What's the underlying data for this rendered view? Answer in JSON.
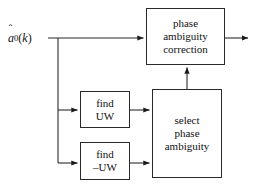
{
  "figure": {
    "type": "block-diagram",
    "title": "",
    "background_color": "#ffffff",
    "line_color": "#2a2a2a",
    "text_color": "#111111"
  },
  "input": {
    "name": "input-signal",
    "label_plain": "â0(k)",
    "base_symbol": "a",
    "hat": "ˆ",
    "subscript": "0",
    "argument": "(k)"
  },
  "blocks": [
    {
      "id": "phase-ambiguity-correction",
      "lines": [
        "phase",
        "ambiguity",
        "correction"
      ]
    },
    {
      "id": "find-uw",
      "lines": [
        "find",
        "UW"
      ]
    },
    {
      "id": "find-minus-uw",
      "lines": [
        "find",
        "–UW"
      ]
    },
    {
      "id": "select-phase-ambiguity",
      "lines": [
        "select",
        "phase",
        "ambiguity"
      ]
    }
  ],
  "connections": [
    {
      "id": "input-to-correction",
      "from": "input-signal",
      "to": "phase-ambiguity-correction",
      "arrow": true
    },
    {
      "id": "input-branch-to-find-uw",
      "from": "input-signal",
      "to": "find-uw",
      "arrow": true
    },
    {
      "id": "input-branch-to-find-minus-uw",
      "from": "input-signal",
      "to": "find-minus-uw",
      "arrow": true
    },
    {
      "id": "find-uw-to-select",
      "from": "find-uw",
      "to": "select-phase-ambiguity",
      "arrow": true
    },
    {
      "id": "find-minus-uw-to-select",
      "from": "find-minus-uw",
      "to": "select-phase-ambiguity",
      "arrow": true
    },
    {
      "id": "select-to-correction",
      "from": "select-phase-ambiguity",
      "to": "phase-ambiguity-correction",
      "arrow": true
    },
    {
      "id": "correction-to-output",
      "from": "phase-ambiguity-correction",
      "to": "output",
      "arrow": true
    }
  ]
}
